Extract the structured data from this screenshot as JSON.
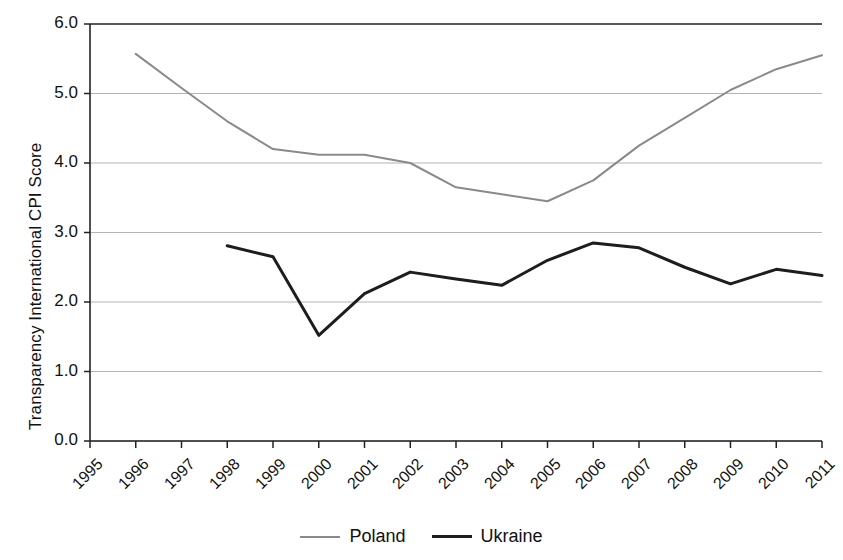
{
  "chart_data": {
    "type": "line",
    "title": "",
    "xlabel": "",
    "ylabel": "Transparency International CPI Score",
    "x": [
      1995,
      1996,
      1997,
      1998,
      1999,
      2000,
      2001,
      2002,
      2003,
      2004,
      2005,
      2006,
      2007,
      2008,
      2009,
      2010,
      2011
    ],
    "xtick_labels": [
      "1995",
      "1996",
      "1997",
      "1998",
      "1999",
      "2000",
      "2001",
      "2002",
      "2003",
      "2004",
      "2005",
      "2006",
      "2007",
      "2008",
      "2009",
      "2010",
      "2011"
    ],
    "ytick_labels": [
      "0.0",
      "1.0",
      "2.0",
      "3.0",
      "4.0",
      "5.0",
      "6.0"
    ],
    "yticks": [
      0.0,
      1.0,
      2.0,
      3.0,
      4.0,
      5.0,
      6.0
    ],
    "ylim": [
      0.0,
      6.0
    ],
    "xlim": [
      1995,
      2011
    ],
    "grid": "horizontal",
    "legend_position": "bottom-center",
    "series": [
      {
        "name": "Poland",
        "color": "#8a8a8a",
        "linewidth": 2,
        "x": [
          1996,
          1997,
          1998,
          1999,
          2000,
          2001,
          2002,
          2003,
          2004,
          2005,
          2006,
          2007,
          2008,
          2009,
          2010,
          2011
        ],
        "values": [
          5.57,
          5.08,
          4.6,
          4.2,
          4.12,
          4.12,
          4.0,
          3.65,
          3.55,
          3.45,
          3.75,
          4.25,
          4.65,
          5.05,
          5.35,
          5.55
        ]
      },
      {
        "name": "Ukraine",
        "color": "#1d1d1d",
        "linewidth": 3,
        "x": [
          1998,
          1999,
          2000,
          2001,
          2002,
          2003,
          2004,
          2005,
          2006,
          2007,
          2008,
          2009,
          2010,
          2011
        ],
        "values": [
          2.81,
          2.65,
          1.52,
          2.12,
          2.43,
          2.33,
          2.24,
          2.6,
          2.85,
          2.78,
          2.5,
          2.26,
          2.47,
          2.38
        ]
      }
    ]
  },
  "legend": {
    "items": [
      {
        "label": "Poland"
      },
      {
        "label": "Ukraine"
      }
    ]
  }
}
